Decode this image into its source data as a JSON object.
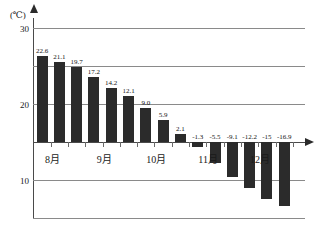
{
  "chart_data": {
    "type": "bar",
    "title": "",
    "subtitle": "",
    "unit_label": "(℃)",
    "xlabel": "",
    "ylabel": "",
    "ylim": [
      -20,
      30
    ],
    "yticks": [
      30,
      20,
      10,
      0,
      -10,
      -20
    ],
    "ytick_labels": [
      "30",
      "20",
      "10",
      "0",
      "-10",
      "-20"
    ],
    "grid": true,
    "legend": "none",
    "categories": [
      "1",
      "2",
      "3",
      "4",
      "5",
      "6",
      "7",
      "8",
      "9",
      "10",
      "11",
      "12",
      "13",
      "14",
      "15"
    ],
    "values": [
      22.6,
      21.1,
      19.7,
      17.2,
      14.2,
      12.1,
      9.0,
      5.9,
      2.1,
      -1.3,
      -5.5,
      -9.1,
      -12.2,
      -15,
      -16.9
    ],
    "value_labels": [
      "22.6",
      "21.1",
      "19.7",
      "17.2",
      "14.2",
      "12.1",
      "9.0",
      "5.9",
      "2.1",
      "-1.3",
      "-5.5",
      "-9.1",
      "-12.2",
      "-15",
      "-16.9"
    ],
    "group_labels": [
      "8月",
      "9月",
      "10月",
      "11月",
      "12月"
    ],
    "bar_color": "#2b2b2b",
    "grid_color": "#8a8a8a",
    "axis_color": "#4a4a4a"
  }
}
